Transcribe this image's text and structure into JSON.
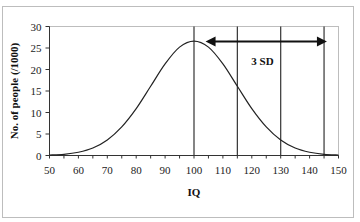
{
  "chart_data": {
    "type": "line",
    "title": "",
    "xlabel": "IQ",
    "ylabel": "No. of people (/1000)",
    "xlim": [
      50,
      150
    ],
    "ylim": [
      0,
      30
    ],
    "x_ticks": [
      50,
      60,
      70,
      80,
      90,
      100,
      110,
      120,
      130,
      140,
      150
    ],
    "y_ticks": [
      0,
      5,
      10,
      15,
      20,
      25,
      30
    ],
    "grid": false,
    "legend": null,
    "series": [
      {
        "name": "IQ distribution",
        "x": [
          50,
          55,
          60,
          65,
          70,
          75,
          80,
          85,
          90,
          95,
          100,
          105,
          110,
          115,
          120,
          125,
          130,
          135,
          140,
          145,
          150
        ],
        "values": [
          0.1,
          0.28,
          0.76,
          1.73,
          3.6,
          6.65,
          10.9,
          16.1,
          21.3,
          25.2,
          26.6,
          25.2,
          21.3,
          16.1,
          10.9,
          6.65,
          3.6,
          1.73,
          0.76,
          0.28,
          0.1
        ]
      }
    ],
    "vertical_lines": [
      100,
      115,
      130,
      145
    ],
    "annotations": [
      {
        "type": "double-arrow",
        "x_from": 104,
        "x_to": 146,
        "y": 26.5
      },
      {
        "type": "text",
        "text": "3 SD",
        "x": 123,
        "y": 22
      }
    ]
  },
  "labels": {
    "xlabel": "IQ",
    "ylabel": "No. of people (/1000)",
    "annotation": "3 SD"
  }
}
